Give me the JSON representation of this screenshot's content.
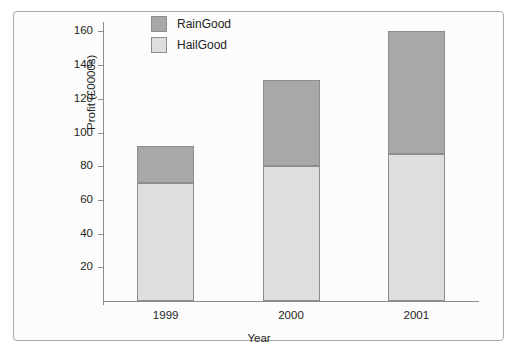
{
  "chart_data": {
    "type": "bar",
    "subtype": "stacked-bar",
    "title": "",
    "xlabel": "Year",
    "ylabel": "Profit (£0000s)",
    "categories": [
      "1999",
      "2000",
      "2001"
    ],
    "series": [
      {
        "name": "HailGood",
        "values": [
          70,
          80,
          87
        ],
        "color": "#dedede"
      },
      {
        "name": "RainGood",
        "values": [
          22,
          51,
          73
        ],
        "color": "#a8a8a8"
      }
    ],
    "totals": [
      92,
      131,
      160
    ],
    "ylim": [
      0,
      168
    ],
    "yticks": [
      20,
      40,
      60,
      80,
      100,
      120,
      140,
      160
    ],
    "ytick_labels": [
      "20",
      "40",
      "60",
      "80",
      "100",
      "120",
      "140",
      "160"
    ],
    "grid": false,
    "legend_position": "top-center-left",
    "legend_entries": [
      "RainGood",
      "HailGood"
    ],
    "bar_edge_color": "#8d8d8d",
    "axis_color": "#8d8d8d",
    "frame_color": "#a9a9a9",
    "background_color": "#fcfcfc"
  }
}
